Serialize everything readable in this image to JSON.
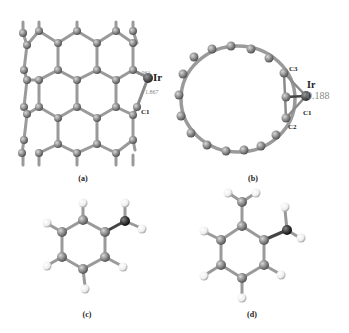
{
  "panels": [
    {
      "id": "a",
      "caption": "(a)",
      "description": "Ir atom adsorbed on carbon nanotube (side view)",
      "atom_labels": {
        "metal": "Ir",
        "carbon": "C1"
      },
      "bond_lengths": [
        "1.961",
        "1.867"
      ]
    },
    {
      "id": "b",
      "caption": "(b)",
      "description": "Ir atom adsorbed on carbon nanotube (axial view)",
      "atom_labels": {
        "metal": "Ir",
        "c3": "C3",
        "c1": "C1",
        "c2": "C2"
      },
      "value": "0.188"
    },
    {
      "id": "c",
      "caption": "(c)",
      "description": "Aniline molecule"
    },
    {
      "id": "d",
      "caption": "(d)",
      "description": "o-Toluidine molecule"
    }
  ],
  "colors": {
    "carbon": "#8a8a8a",
    "bond": "#9a9a9a",
    "metal": "#555555",
    "nitrogen": "#3a3a3a",
    "hydrogen": "#f2f2f2",
    "label_gray": "#888888",
    "text": "#222222"
  }
}
